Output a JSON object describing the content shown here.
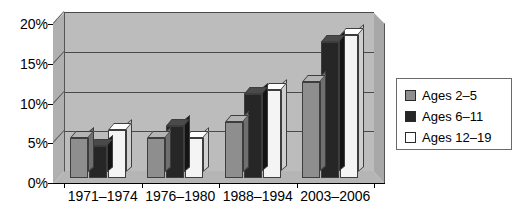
{
  "chart_data": {
    "type": "bar",
    "title": "",
    "subtitle": "",
    "xlabel": "",
    "ylabel": "",
    "categories": [
      "1971–1974",
      "1976–1980",
      "1988–1994",
      "2003–2006"
    ],
    "series": [
      {
        "name": "Ages 2–5",
        "color": "#8e8e8e",
        "values": [
          5,
          5,
          7,
          12
        ]
      },
      {
        "name": "Ages 6–11",
        "color": "#262626",
        "values": [
          4,
          6.5,
          10.5,
          17
        ]
      },
      {
        "name": "Ages 12–19",
        "color": "#ffffff",
        "values": [
          6,
          5,
          11,
          18
        ]
      }
    ],
    "ylim": [
      0,
      20
    ],
    "yticks": [
      0,
      5,
      10,
      15,
      20
    ],
    "ytick_labels": [
      "0%",
      "5%",
      "10%",
      "15%",
      "20%"
    ],
    "grid": true,
    "legend_position": "right",
    "style": "3d-column",
    "plot_background": "#bcbcbc",
    "gridline_color": "#4a4a4a"
  },
  "legend": {
    "items": [
      {
        "label": "Ages 2–5"
      },
      {
        "label": "Ages 6–11"
      },
      {
        "label": "Ages 12–19"
      }
    ]
  }
}
